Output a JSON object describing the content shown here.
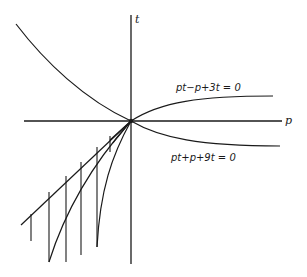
{
  "diagram": {
    "axes": {
      "x_label": "p",
      "y_label": "t"
    },
    "curves": [
      {
        "id": "upper-right",
        "equation": "pt−p+3t = 0"
      },
      {
        "id": "lower-right",
        "equation": "pt+p+9t = 0"
      },
      {
        "id": "upper-left",
        "equation": ""
      }
    ],
    "colors": {
      "line": "#1a1a1a",
      "background": "#ffffff"
    }
  }
}
